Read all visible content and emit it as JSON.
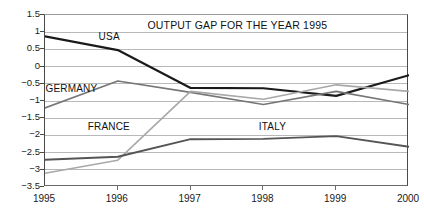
{
  "chart_data": {
    "type": "line",
    "title": "OUTPUT GAP FOR THE YEAR 1995",
    "xlabel": "",
    "ylabel": "",
    "categories": [
      "1995",
      "1996",
      "1997",
      "1998",
      "1999",
      "2000"
    ],
    "x": [
      1995,
      1996,
      1997,
      1998,
      1999,
      2000
    ],
    "ylim": [
      -3.5,
      1.5
    ],
    "yticks": [
      1.5,
      1,
      0.5,
      0,
      -0.5,
      -1,
      -1.5,
      -2,
      -2.5,
      -3,
      -3.5
    ],
    "ytick_labels": [
      "1.5",
      "1",
      "0.5",
      "0",
      "−0.5",
      "−1",
      "−1.5",
      "−2",
      "−2.5",
      "−3",
      "−3.5"
    ],
    "grid": "horizontal",
    "legend": "inline-labels",
    "series": [
      {
        "name": "USA",
        "color": "#1a1a1a",
        "width": 2.2,
        "values": [
          0.88,
          0.48,
          -0.62,
          -0.63,
          -0.85,
          -0.25
        ]
      },
      {
        "name": "GERMANY",
        "color": "#777777",
        "width": 1.6,
        "values": [
          -1.2,
          -0.42,
          -0.75,
          -1.1,
          -0.72,
          -1.1
        ]
      },
      {
        "name": "FRANCE",
        "color": "#a8a8a8",
        "width": 1.6,
        "values": [
          -3.1,
          -2.72,
          -0.72,
          -0.95,
          -0.53,
          -0.72
        ]
      },
      {
        "name": "ITALY",
        "color": "#555555",
        "width": 1.9,
        "values": [
          -2.71,
          -2.62,
          -2.11,
          -2.1,
          -2.02,
          -2.33
        ]
      }
    ],
    "annotations": [
      {
        "text": "USA",
        "x": 1995.75,
        "y": 0.82
      },
      {
        "text": "GERMANY",
        "x": 1995.02,
        "y": -0.68
      },
      {
        "text": "FRANCE",
        "x": 1995.6,
        "y": -1.78
      },
      {
        "text": "ITALY",
        "x": 1997.95,
        "y": -1.78
      }
    ]
  },
  "axes": {
    "gridline_color": "#b8b8b8",
    "frame_color": "#4a4a4a",
    "background": "#ffffff"
  }
}
